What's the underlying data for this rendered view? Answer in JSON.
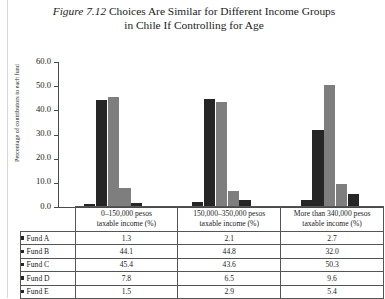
{
  "figure": {
    "number": "Figure 7.12",
    "title_line1": "Choices Are Similar for Different Income Groups",
    "title_line2": "in Chile If Controlling for Age"
  },
  "colors": {
    "dark_series": "#262626",
    "light_series": "#7e7e7e",
    "axis": "#4a4a4a",
    "table_border": "#555555"
  },
  "chart_data": {
    "type": "bar",
    "title": "Figure 7.12 Choices Are Similar for Different Income Groups in Chile If Controlling for Age",
    "xlabel": "",
    "ylabel": "Percentage of contributors to each fund",
    "ylim": [
      0.0,
      60.0
    ],
    "ytick_labels": [
      "0.0",
      "10.0",
      "20.0",
      "30.0",
      "40.0",
      "50.0",
      "60.0"
    ],
    "ytick_values": [
      0.0,
      10.0,
      20.0,
      30.0,
      40.0,
      50.0,
      60.0
    ],
    "grid": false,
    "legend_position": "table-row-markers",
    "categories": [
      "0–150,000 pesos taxable income (%)",
      "150,000–350,000 pesos taxable income (%)",
      "More than 340,000 pesos taxable income (%)"
    ],
    "series": [
      {
        "name": "Fund A",
        "color": "#262626",
        "values": [
          1.3,
          2.1,
          2.7
        ]
      },
      {
        "name": "Fund B",
        "color": "#262626",
        "values": [
          44.1,
          44.8,
          32.0
        ]
      },
      {
        "name": "Fund C",
        "color": "#7e7e7e",
        "values": [
          45.4,
          43.6,
          50.3
        ]
      },
      {
        "name": "Fund D",
        "color": "#7e7e7e",
        "values": [
          7.8,
          6.5,
          9.6
        ]
      },
      {
        "name": "Fund E",
        "color": "#262626",
        "values": [
          1.5,
          2.9,
          5.4
        ]
      }
    ]
  },
  "table": {
    "corner_label": "",
    "column_headers": [
      {
        "line1": "0–150,000 pesos",
        "line2": "taxable income (%)"
      },
      {
        "line1": "150,000–350,000 pesos",
        "line2": "taxable income (%)"
      },
      {
        "line1": "More than 340,000 pesos",
        "line2": "taxable income (%)"
      }
    ],
    "rows": [
      {
        "label": "Fund A",
        "swatch": "#262626",
        "values": [
          "1.3",
          "2.1",
          "2.7"
        ]
      },
      {
        "label": "Fund B",
        "swatch": "#262626",
        "values": [
          "44.1",
          "44.8",
          "32.0"
        ]
      },
      {
        "label": "Fund C",
        "swatch": "#262626",
        "values": [
          "45.4",
          "43.6",
          "50.3"
        ]
      },
      {
        "label": "Fund D",
        "swatch": "#262626",
        "values": [
          "7.8",
          "6.5",
          "9.6"
        ]
      },
      {
        "label": "Fund E",
        "swatch": "#262626",
        "values": [
          "1.5",
          "2.9",
          "5.4"
        ]
      }
    ]
  }
}
